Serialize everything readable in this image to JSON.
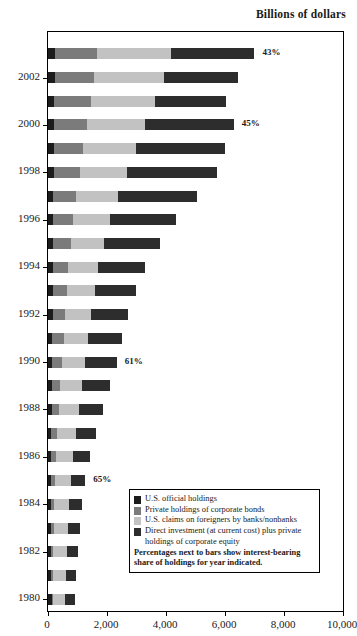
{
  "header": {
    "title": "Billions of dollars"
  },
  "axis": {
    "x_ticks": [
      "0",
      "2,000",
      "4,000",
      "6,000",
      "8,000",
      "10,000"
    ],
    "x_tick_values": [
      0,
      2000,
      4000,
      6000,
      8000,
      10000
    ],
    "y_labels": [
      "2002",
      "2000",
      "1998",
      "1996",
      "1994",
      "1992",
      "1990",
      "1988",
      "1986",
      "1984",
      "1982",
      "1980"
    ]
  },
  "legend": {
    "items": [
      {
        "label": "U.S. official holdings",
        "color": "#1c1c1c"
      },
      {
        "label": "Private holdings of corporate bonds",
        "color": "#7b7b7b"
      },
      {
        "label": "U.S. claims on foreigners by banks/nonbanks",
        "color": "#c2c2c2"
      },
      {
        "label": "Direct investment (at current cost) plus private",
        "color": "#2d2d2d"
      }
    ],
    "item4_line2": "holdings of corporate equity",
    "note_line1": "Percentages next to bars show interest-bearing",
    "note_line2": "share of holdings for year indicated."
  },
  "chart_data": {
    "type": "bar",
    "orientation": "horizontal",
    "stacked": true,
    "title": "Billions of dollars",
    "xlabel": "",
    "ylabel": "",
    "xlim": [
      0,
      10000
    ],
    "grid": false,
    "legend_position": "inside-bottom-right",
    "categories": [
      "1980",
      "1981",
      "1982",
      "1983",
      "1984",
      "1985",
      "1986",
      "1987",
      "1988",
      "1989",
      "1990",
      "1991",
      "1992",
      "1993",
      "1994",
      "1995",
      "1996",
      "1997",
      "1998",
      "1999",
      "2000",
      "2001",
      "2002",
      "2003"
    ],
    "series": [
      {
        "name": "U.S. official holdings",
        "color": "#1c1c1c",
        "values": [
          120,
          110,
          105,
          100,
          95,
          95,
          100,
          110,
          120,
          130,
          140,
          150,
          155,
          160,
          165,
          175,
          180,
          185,
          195,
          200,
          205,
          215,
          225,
          230
        ]
      },
      {
        "name": "Private holdings of corporate bonds",
        "color": "#7b7b7b",
        "values": [
          60,
          70,
          80,
          95,
          110,
          130,
          160,
          200,
          240,
          290,
          340,
          380,
          420,
          470,
          520,
          600,
          680,
          780,
          880,
          1000,
          1120,
          1240,
          1340,
          1420
        ]
      },
      {
        "name": "U.S. claims on foreigners by banks/nonbanks",
        "color": "#c2c2c2",
        "values": [
          390,
          420,
          470,
          500,
          520,
          560,
          600,
          640,
          690,
          740,
          790,
          830,
          880,
          950,
          1020,
          1130,
          1250,
          1420,
          1600,
          1800,
          1980,
          2170,
          2360,
          2520
        ]
      },
      {
        "name": "Direct investment (at current cost) plus private holdings of corporate equity",
        "color": "#2d2d2d",
        "values": [
          330,
          350,
          370,
          390,
          420,
          480,
          560,
          680,
          800,
          930,
          1060,
          1150,
          1260,
          1400,
          1580,
          1900,
          2230,
          2680,
          3050,
          3010,
          2990,
          2400,
          2500,
          2830
        ]
      }
    ],
    "bar_totals": [
      900,
      950,
      1025,
      1085,
      1145,
      1265,
      1420,
      1630,
      1850,
      2090,
      2330,
      2510,
      2715,
      2980,
      3285,
      3805,
      4340,
      5065,
      5725,
      6010,
      6295,
      6025,
      6425,
      7000
    ],
    "annotations": [
      {
        "category": "2003",
        "text": "43%",
        "value": 43
      },
      {
        "category": "2000",
        "text": "45%",
        "value": 45
      },
      {
        "category": "1990",
        "text": "61%",
        "value": 61
      },
      {
        "category": "1985",
        "text": "65%",
        "value": 65
      }
    ]
  }
}
